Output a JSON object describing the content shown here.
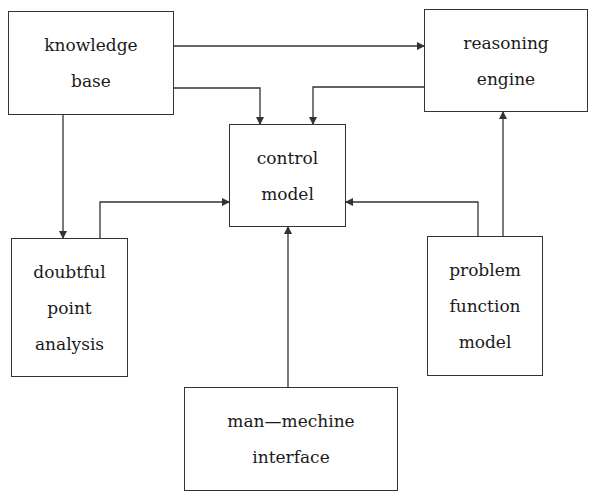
{
  "diagram": {
    "type": "block-flow",
    "nodes": [
      {
        "id": "knowledge_base",
        "lines": [
          "knowledge",
          "base"
        ]
      },
      {
        "id": "reasoning_engine",
        "lines": [
          "reasoning",
          "engine"
        ]
      },
      {
        "id": "control_model",
        "lines": [
          "control",
          "model"
        ]
      },
      {
        "id": "doubtful_point_analysis",
        "lines": [
          "doubtful",
          "point",
          "analysis"
        ]
      },
      {
        "id": "problem_function_model",
        "lines": [
          "problem",
          "function",
          "model"
        ]
      },
      {
        "id": "man_mechine_interface",
        "lines": [
          "man—mechine",
          "interface"
        ]
      }
    ],
    "edges": [
      {
        "from": "knowledge_base",
        "to": "reasoning_engine"
      },
      {
        "from": "knowledge_base",
        "to": "control_model"
      },
      {
        "from": "knowledge_base",
        "to": "doubtful_point_analysis"
      },
      {
        "from": "reasoning_engine",
        "to": "control_model"
      },
      {
        "from": "doubtful_point_analysis",
        "to": "control_model"
      },
      {
        "from": "problem_function_model",
        "to": "control_model"
      },
      {
        "from": "problem_function_model",
        "to": "reasoning_engine"
      },
      {
        "from": "man_mechine_interface",
        "to": "control_model"
      }
    ],
    "colors": {
      "line": "#333333",
      "background": "#ffffff",
      "text": "#1a1a1a"
    }
  }
}
